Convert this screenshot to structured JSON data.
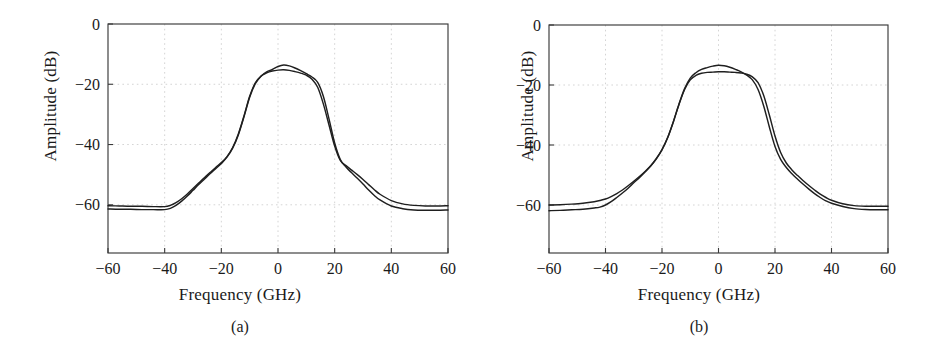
{
  "figure": {
    "panels": [
      {
        "id": "a",
        "caption": "(a)",
        "xlabel": "Frequency (GHz)",
        "ylabel": "Amplitude (dB)"
      },
      {
        "id": "b",
        "caption": "(b)",
        "xlabel": "Frequency (GHz)",
        "ylabel": "Amplitude (dB)"
      }
    ]
  },
  "chart_data": [
    {
      "type": "line",
      "panel": "a",
      "title": "",
      "xlabel": "Frequency (GHz)",
      "ylabel": "Amplitude (dB)",
      "xlim": [
        -60,
        60
      ],
      "ylim": [
        -76,
        0
      ],
      "xticks": [
        -60,
        -40,
        -20,
        0,
        20,
        40,
        60
      ],
      "yticks": [
        0,
        -20,
        -40,
        -60
      ],
      "xticklabels": [
        "−60",
        "−40",
        "−20",
        "0",
        "20",
        "40",
        "60"
      ],
      "yticklabels": [
        "0",
        "−20",
        "−40",
        "−60"
      ],
      "grid": true,
      "legend": "none",
      "x": [
        -60,
        -56,
        -52,
        -48,
        -44,
        -40,
        -38,
        -36,
        -34,
        -32,
        -30,
        -28,
        -26,
        -24,
        -22,
        -20,
        -18,
        -16,
        -14,
        -12,
        -10,
        -8,
        -6,
        -4,
        -2,
        0,
        2,
        4,
        6,
        8,
        10,
        12,
        14,
        16,
        18,
        20,
        22,
        24,
        26,
        28,
        30,
        32,
        34,
        36,
        40,
        44,
        48,
        52,
        56,
        60
      ],
      "series": [
        {
          "name": "curve-1",
          "values": [
            -60.3,
            -60.4,
            -60.5,
            -60.5,
            -60.6,
            -60.6,
            -60.2,
            -59.3,
            -58.0,
            -56.4,
            -54.6,
            -52.8,
            -51.0,
            -49.3,
            -47.6,
            -46.0,
            -44.0,
            -41.0,
            -36.5,
            -30.5,
            -24.0,
            -19.5,
            -17.3,
            -16.2,
            -15.6,
            -15.3,
            -15.2,
            -15.4,
            -15.8,
            -16.3,
            -17.0,
            -18.3,
            -21.0,
            -26.5,
            -33.5,
            -40.5,
            -45.3,
            -47.0,
            -48.5,
            -50.0,
            -51.6,
            -53.3,
            -55.0,
            -56.5,
            -58.6,
            -59.7,
            -60.2,
            -60.4,
            -60.4,
            -60.3
          ]
        },
        {
          "name": "curve-2",
          "values": [
            -61.4,
            -61.5,
            -61.5,
            -61.6,
            -61.6,
            -61.6,
            -61.2,
            -60.2,
            -58.8,
            -57.1,
            -55.2,
            -53.3,
            -51.5,
            -49.7,
            -48.0,
            -46.3,
            -44.2,
            -41.2,
            -36.8,
            -30.8,
            -24.3,
            -19.8,
            -17.3,
            -15.9,
            -15.1,
            -14.1,
            -13.6,
            -13.9,
            -14.6,
            -15.5,
            -16.5,
            -17.6,
            -19.4,
            -24.0,
            -31.5,
            -39.5,
            -45.0,
            -47.5,
            -49.4,
            -51.2,
            -53.1,
            -55.1,
            -56.9,
            -58.4,
            -60.4,
            -61.3,
            -61.7,
            -61.8,
            -61.8,
            -61.7
          ]
        }
      ]
    },
    {
      "type": "line",
      "panel": "b",
      "title": "",
      "xlabel": "Frequency (GHz)",
      "ylabel": "Amplitude (dB)",
      "xlim": [
        -60,
        60
      ],
      "ylim": [
        -76,
        0
      ],
      "xticks": [
        -60,
        -40,
        -20,
        0,
        20,
        40,
        60
      ],
      "yticks": [
        0,
        -20,
        -40,
        -60
      ],
      "xticklabels": [
        "−60",
        "−40",
        "−20",
        "0",
        "20",
        "40",
        "60"
      ],
      "yticklabels": [
        "0",
        "−20",
        "−40",
        "−60"
      ],
      "grid": true,
      "legend": "none",
      "x": [
        -60,
        -56,
        -52,
        -48,
        -44,
        -42,
        -40,
        -38,
        -36,
        -34,
        -32,
        -30,
        -28,
        -26,
        -24,
        -22,
        -20,
        -18,
        -16,
        -14,
        -12,
        -10,
        -8,
        -6,
        -4,
        -2,
        0,
        2,
        4,
        6,
        8,
        10,
        12,
        14,
        16,
        18,
        20,
        22,
        24,
        26,
        28,
        30,
        32,
        34,
        36,
        38,
        40,
        44,
        48,
        52,
        56,
        60
      ],
      "series": [
        {
          "name": "curve-1",
          "values": [
            -60.0,
            -59.9,
            -59.7,
            -59.4,
            -58.9,
            -58.5,
            -58.0,
            -57.2,
            -56.2,
            -55.0,
            -53.6,
            -52.1,
            -50.5,
            -48.8,
            -46.9,
            -44.5,
            -41.5,
            -37.5,
            -32.3,
            -26.5,
            -21.5,
            -18.3,
            -16.8,
            -16.1,
            -15.8,
            -15.7,
            -15.6,
            -15.6,
            -15.7,
            -15.8,
            -16.0,
            -16.4,
            -17.3,
            -19.2,
            -23.5,
            -30.0,
            -37.0,
            -42.5,
            -46.0,
            -48.3,
            -50.2,
            -51.9,
            -53.5,
            -55.0,
            -56.4,
            -57.5,
            -58.4,
            -59.6,
            -60.2,
            -60.4,
            -60.4,
            -60.4
          ]
        },
        {
          "name": "curve-2",
          "values": [
            -61.9,
            -61.8,
            -61.6,
            -61.4,
            -61.0,
            -60.7,
            -60.0,
            -58.9,
            -57.5,
            -56.0,
            -54.4,
            -52.6,
            -50.9,
            -49.0,
            -47.0,
            -44.6,
            -41.6,
            -37.6,
            -32.3,
            -26.4,
            -21.2,
            -17.7,
            -15.9,
            -14.8,
            -14.2,
            -13.7,
            -13.4,
            -13.6,
            -14.1,
            -14.8,
            -15.6,
            -16.7,
            -18.3,
            -21.5,
            -27.0,
            -34.0,
            -40.5,
            -44.8,
            -47.5,
            -49.6,
            -51.4,
            -53.1,
            -54.7,
            -56.2,
            -57.5,
            -58.6,
            -59.4,
            -60.5,
            -61.2,
            -61.5,
            -61.6,
            -61.6
          ]
        }
      ]
    }
  ]
}
